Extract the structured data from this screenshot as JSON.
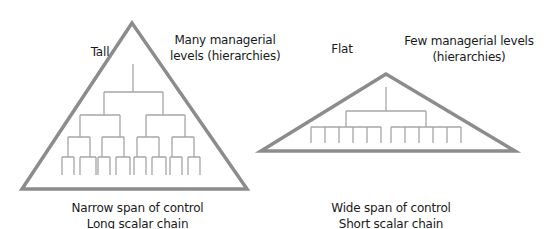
{
  "diagram": {
    "colors": {
      "triangle": "#8c8c8c",
      "tree": "#a6a6a6",
      "text": "#1a1a1a",
      "background": "#ffffff"
    },
    "tall": {
      "title": "Tall",
      "levels_note": [
        "Many managerial",
        "levels (hierarchies)"
      ],
      "caption": [
        "Narrow span of control",
        "Long scalar chain"
      ]
    },
    "flat": {
      "title": "Flat",
      "levels_note": [
        "Few managerial levels",
        "(hierarchies)"
      ],
      "caption": [
        "Wide span of control",
        "Short scalar chain"
      ]
    }
  }
}
